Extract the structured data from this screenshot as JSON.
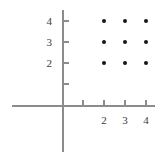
{
  "chart_data": {
    "type": "scatter",
    "title": "",
    "subtitle": "",
    "xlabel": "",
    "ylabel": "",
    "grid": false,
    "legend": false,
    "legend_position": "none",
    "xlim": [
      -2.5,
      4.6
    ],
    "ylim": [
      -2.3,
      4.6
    ],
    "x_ticks": [
      1,
      2,
      3,
      4
    ],
    "y_ticks": [
      1,
      2,
      3,
      4
    ],
    "x_tick_labels": [
      "",
      "2",
      "3",
      "4"
    ],
    "y_tick_labels": [
      "",
      "2",
      "3",
      "4"
    ],
    "point_color": "#161616",
    "axis_color": "#8c8c8c",
    "background_color": "#ffffff",
    "points": [
      {
        "x": 2,
        "y": 4
      },
      {
        "x": 3,
        "y": 4
      },
      {
        "x": 4,
        "y": 4
      },
      {
        "x": 2,
        "y": 3
      },
      {
        "x": 3,
        "y": 3
      },
      {
        "x": 4,
        "y": 3
      },
      {
        "x": 2,
        "y": 2
      },
      {
        "x": 3,
        "y": 2
      },
      {
        "x": 4,
        "y": 2
      }
    ]
  },
  "geometry": {
    "origin_x": 62,
    "origin_y": 105,
    "unit_px": 21
  }
}
